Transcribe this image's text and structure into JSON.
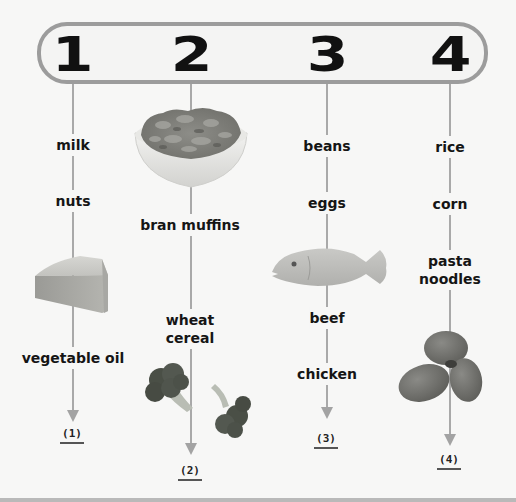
{
  "header": {
    "numbers": [
      "1",
      "2",
      "3",
      "4"
    ]
  },
  "columns": [
    {
      "number": "1",
      "items": [
        "milk",
        "nuts",
        "vegetable oil"
      ],
      "images": [
        "cheese-wedge"
      ],
      "answer_blank": "(1)"
    },
    {
      "number": "2",
      "items": [
        "bran muffins",
        "wheat",
        "cereal"
      ],
      "item_full": [
        "bran muffins",
        "wheat cereal"
      ],
      "images": [
        "cereal-bowl",
        "broccoli"
      ],
      "answer_blank": "(2)"
    },
    {
      "number": "3",
      "items": [
        "beans",
        "eggs",
        "beef",
        "chicken"
      ],
      "images": [
        "fish"
      ],
      "answer_blank": "(3)"
    },
    {
      "number": "4",
      "items": [
        "rice",
        "corn",
        "pasta",
        "noodles"
      ],
      "item_full": [
        "rice",
        "corn",
        "pasta noodles"
      ],
      "images": [
        "potatoes"
      ],
      "answer_blank": "(4)"
    }
  ],
  "colors": {
    "background": "#f7f7f6",
    "pill_border": "#9c9c9c",
    "lines": "#a9a9a9",
    "text": "#151515"
  }
}
